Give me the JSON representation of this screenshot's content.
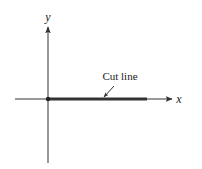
{
  "figure": {
    "type": "complex-plane-branch-cut",
    "width": 202,
    "height": 169,
    "colors": {
      "background": "#ffffff",
      "stroke": "#333333",
      "text": "#222222"
    },
    "axes": {
      "origin": {
        "x": 48,
        "y": 99
      },
      "x_axis": {
        "label": "x",
        "from": 15,
        "to": 172,
        "label_pos": {
          "x": 179,
          "y": 103
        }
      },
      "y_axis": {
        "label": "y",
        "from": 163,
        "to": 27,
        "label_pos": {
          "x": 48,
          "y": 21
        }
      }
    },
    "cut_line": {
      "label": "Cut line",
      "from_x": 48,
      "to_x": 147,
      "y": 99,
      "label_pos": {
        "x": 120,
        "y": 80
      },
      "pointer": {
        "from": {
          "x": 114,
          "y": 86
        },
        "to": {
          "x": 104,
          "y": 97
        }
      }
    },
    "origin_point": {
      "marker": "dot"
    }
  }
}
